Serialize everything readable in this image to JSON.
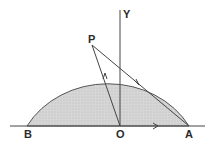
{
  "diagram": {
    "labels": {
      "P": "P",
      "Y": "Y",
      "B": "B",
      "O": "O",
      "A": "A"
    },
    "colors": {
      "fill": "#d4d4d4",
      "stroke": "#4a4a4a",
      "background": "#ffffff"
    },
    "points": {
      "O": [
        120,
        126
      ],
      "A": [
        189,
        126
      ],
      "B": [
        27,
        126
      ],
      "P": [
        92,
        46
      ]
    },
    "radius": 69
  }
}
